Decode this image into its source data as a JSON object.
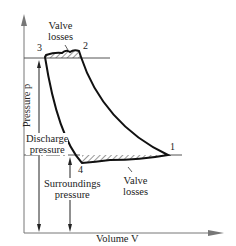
{
  "diagram": {
    "title": "",
    "axes": {
      "x_label": "Volume V",
      "y_label": "Pressure p"
    },
    "points": [
      {
        "id": "1",
        "label": "1"
      },
      {
        "id": "2",
        "label": "2"
      },
      {
        "id": "3",
        "label": "3"
      },
      {
        "id": "4",
        "label": "4"
      }
    ],
    "annotations": {
      "valve_losses_top": [
        "Valve",
        "losses"
      ],
      "valve_losses_bottom": [
        "Valve",
        "losses"
      ],
      "discharge_pressure": [
        "Discharge",
        "pressure"
      ],
      "surroundings_pressure": [
        "Surroundings",
        "pressure"
      ]
    },
    "colors": {
      "line": "#111111",
      "axis": "#777777",
      "hatch": "#333333"
    }
  }
}
